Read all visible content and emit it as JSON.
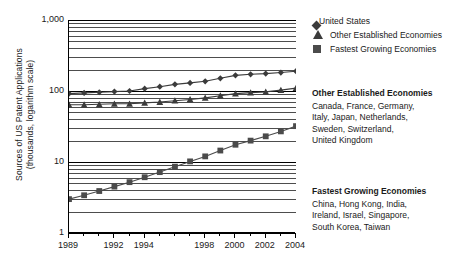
{
  "chart_data": {
    "type": "line",
    "title": "",
    "xlabel": "",
    "ylabel": "Sources of US Patent Applications\n(thousands, logarithm scale)",
    "scale": "log",
    "grid": true,
    "xlim": [
      1989,
      2004
    ],
    "ylim": [
      1,
      1000
    ],
    "ytick_labels": [
      "1,000",
      "100",
      "10",
      "1"
    ],
    "ytick_values": [
      1000,
      100,
      10,
      1
    ],
    "xtick_labels": [
      "1989",
      "1992",
      "1994",
      "1998",
      "2000",
      "2002",
      "2004"
    ],
    "xtick_values": [
      1989,
      1992,
      1994,
      1998,
      2000,
      2002,
      2004
    ],
    "x": [
      1989,
      1990,
      1991,
      1992,
      1993,
      1994,
      1995,
      1996,
      1997,
      1998,
      1999,
      2000,
      2001,
      2002,
      2003,
      2004
    ],
    "series": [
      {
        "name": "United States",
        "marker": "diamond",
        "values": [
          92,
          94,
          96,
          98,
          100,
          108,
          115,
          124,
          130,
          137,
          151,
          166,
          172,
          176,
          182,
          190
        ]
      },
      {
        "name": "Other Established Economies",
        "marker": "triangle",
        "values": [
          64,
          64,
          65,
          66,
          66,
          68,
          70,
          73,
          76,
          80,
          86,
          92,
          95,
          97,
          103,
          110
        ]
      },
      {
        "name": "Fastest Growing Economies",
        "marker": "square",
        "values": [
          3.0,
          3.4,
          3.9,
          4.5,
          5.2,
          6.1,
          7.2,
          8.6,
          10.2,
          12.0,
          14.5,
          17.5,
          20.0,
          23.0,
          27.0,
          32.0
        ]
      }
    ],
    "legend_position": "right-top"
  },
  "axis": {
    "y_title": "Sources of US Patent Applications\n(thousands, logarithm scale)"
  },
  "legend": {
    "items": [
      {
        "label": "United States",
        "marker": "diamond"
      },
      {
        "label": "Other Established Economies",
        "marker": "triangle"
      },
      {
        "label": "Fastest Growing Economies",
        "marker": "square"
      }
    ]
  },
  "notes": {
    "established": {
      "heading": "Other Established Economies",
      "body": "Canada, France, Germany,\nItaly, Japan, Netherlands,\nSweden, Switzerland,\nUnited Kingdom"
    },
    "fastest": {
      "heading": "Fastest Growing Economies",
      "body": "China, Hong Kong, India,\nIreland, Israel, Singapore,\nSouth Korea, Taiwan"
    }
  },
  "colors": {
    "series_us": "#3b3b3b",
    "series_established": "#3b3b3b",
    "series_fastest": "#4b4b4b",
    "grid": "#4d4d4d",
    "axis": "#000000"
  }
}
